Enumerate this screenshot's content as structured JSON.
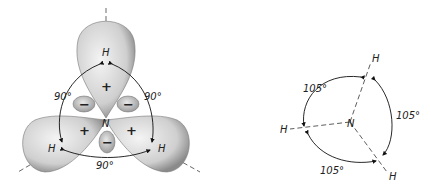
{
  "left_diagram": {
    "title": "Orbital model of NH3 with p-orbital lobes",
    "center_atom": "N",
    "hydrogens": [
      "H",
      "H",
      "H"
    ],
    "angles": [
      "90°",
      "90°",
      "90°"
    ],
    "positive_signs": [
      "+",
      "+",
      "+"
    ],
    "negative_signs": [
      "−",
      "−",
      "−"
    ]
  },
  "right_diagram": {
    "title": "Observed bond angles of NH3",
    "center_atom": "N",
    "hydrogens": [
      "H",
      "H",
      "H"
    ],
    "angles": [
      "105°",
      "105°",
      "105°"
    ]
  }
}
